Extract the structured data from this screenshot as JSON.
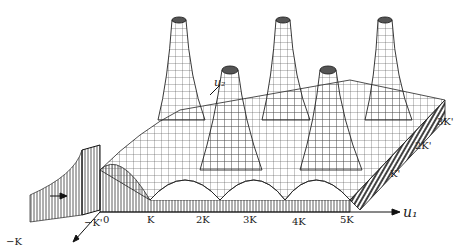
{
  "figure": {
    "title": "",
    "x_axis_label": "u₁",
    "y_axis_label": "u₂",
    "x_ticks": [
      "−K",
      "0",
      "K",
      "2K",
      "3K",
      "4K",
      "5K"
    ],
    "y_ticks": [
      "−K'",
      "K'",
      "2K'",
      "3K'"
    ],
    "ink_color": "#1a1a1a",
    "background": "#ffffff"
  }
}
